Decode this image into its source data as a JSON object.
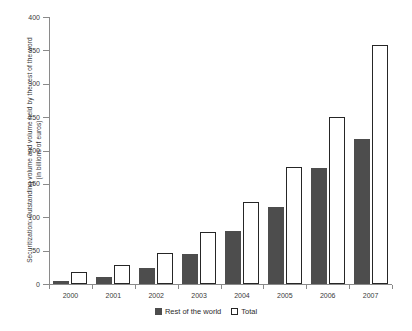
{
  "chart_data": {
    "type": "bar",
    "title": "",
    "xlabel": "",
    "ylabel": "Securitization: Outstanding volume and volume held by the rest of the word (in billions of euros)",
    "ylabel_lines": [
      "Securitization: Outstanding volume and volume held by the rest of the word",
      "(in billions of euros)"
    ],
    "categories": [
      "2000",
      "2001",
      "2002",
      "2003",
      "2004",
      "2005",
      "2006",
      "2007"
    ],
    "series": [
      {
        "name": "Rest of the world",
        "color": "#4d4d4d",
        "values": [
          5,
          10,
          24,
          45,
          79,
          115,
          174,
          218
        ]
      },
      {
        "name": "Total",
        "color": "#ffffff",
        "values": [
          18,
          28,
          47,
          78,
          123,
          176,
          250,
          358
        ]
      }
    ],
    "ylim": [
      0,
      400
    ],
    "yticks": [
      0,
      50,
      100,
      150,
      200,
      250,
      300,
      350,
      400
    ],
    "ytick_labels": [
      "0",
      "50",
      "100",
      "150",
      "200",
      "250",
      "300",
      "350",
      "400"
    ],
    "grid": false,
    "legend_position": "bottom"
  },
  "legend": {
    "items": [
      {
        "label": "Rest of the world",
        "swatch": "filled-square-icon"
      },
      {
        "label": "Total",
        "swatch": "outlined-square-icon"
      }
    ]
  },
  "colors": {
    "bar_rest_of_world": "#4d4d4d",
    "bar_total_fill": "#ffffff",
    "bar_total_border": "#262626",
    "axis": "#8a8a8a",
    "text": "#2b2b2b",
    "background": "#ffffff"
  }
}
